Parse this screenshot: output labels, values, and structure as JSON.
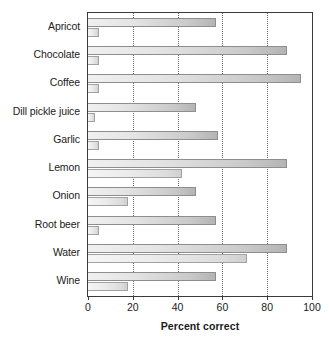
{
  "chart_data": {
    "type": "bar",
    "orientation": "horizontal",
    "title": "",
    "xlabel": "Percent correct",
    "ylabel": "",
    "xlim": [
      0,
      100
    ],
    "xticks": [
      0,
      20,
      40,
      60,
      80,
      100
    ],
    "xticklabels": [
      "0",
      "20",
      "40",
      "60",
      "80",
      "100"
    ],
    "grid": "vertical-dotted",
    "legend": "none",
    "categories": [
      "Apricot",
      "Chocolate",
      "Coffee",
      "Dill pickle juice",
      "Garlic",
      "Lemon",
      "Onion",
      "Root beer",
      "Water",
      "Wine"
    ],
    "series": [
      {
        "name": "Series A",
        "values": [
          57,
          89,
          95,
          48,
          58,
          89,
          48,
          57,
          89,
          57
        ]
      },
      {
        "name": "Series B",
        "values": [
          5,
          5,
          5,
          3,
          5,
          42,
          18,
          5,
          71,
          18
        ]
      }
    ],
    "colors": {
      "bar_fill_light": "#f0f0f0",
      "bar_fill_dark": "#b4b4b4",
      "bar_outline": "#8e8e8e",
      "axis": "#3a3a3a",
      "gridline": "#6d6d6d",
      "text": "#1b1b1b",
      "background": "#ffffff"
    }
  }
}
